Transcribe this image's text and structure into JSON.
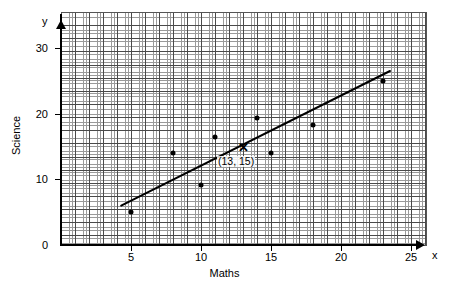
{
  "chart_data": {
    "type": "scatter",
    "title": "",
    "xlabel": "Maths",
    "ylabel": "Science",
    "x_axis_letter": "x",
    "y_axis_letter": "y",
    "xlim": [
      0,
      26.1
    ],
    "ylim": [
      0,
      35.4
    ],
    "grid": true,
    "grid_style": "graph paper, minor squares with heavier line every 5 squares",
    "legend": null,
    "x_ticks": [
      {
        "value": 5,
        "label": "5"
      },
      {
        "value": 10,
        "label": "10"
      },
      {
        "value": 15,
        "label": "15"
      },
      {
        "value": 20,
        "label": "20"
      },
      {
        "value": 25,
        "label": "25"
      }
    ],
    "y_ticks": [
      {
        "value": 0,
        "label": "0"
      },
      {
        "value": 10,
        "label": "10"
      },
      {
        "value": 20,
        "label": "20"
      },
      {
        "value": 30,
        "label": "30"
      }
    ],
    "points": [
      {
        "x": 5,
        "y": 5.0
      },
      {
        "x": 8,
        "y": 14.0
      },
      {
        "x": 10,
        "y": 9.2
      },
      {
        "x": 11,
        "y": 16.5
      },
      {
        "x": 13,
        "y": 15.0,
        "marker": "cross",
        "highlighted": true
      },
      {
        "x": 14,
        "y": 19.3
      },
      {
        "x": 15,
        "y": 14.0
      },
      {
        "x": 18,
        "y": 18.3
      },
      {
        "x": 23,
        "y": 25.0
      }
    ],
    "line_of_best_fit": {
      "x1": 4.3,
      "y1": 6.0,
      "x2": 23.5,
      "y2": 26.5,
      "color": "#000000",
      "width": 2
    },
    "annotations": [
      {
        "text": "(13, 15)",
        "x": 13.0,
        "y": 12.6,
        "anchor_point": {
          "x": 13,
          "y": 15
        }
      }
    ]
  },
  "colors": {
    "axis": "#000000",
    "grid_major": "#4a4a4a",
    "grid_minor": "#9a9a9a",
    "marker": "#000000",
    "background": "#ffffff"
  }
}
